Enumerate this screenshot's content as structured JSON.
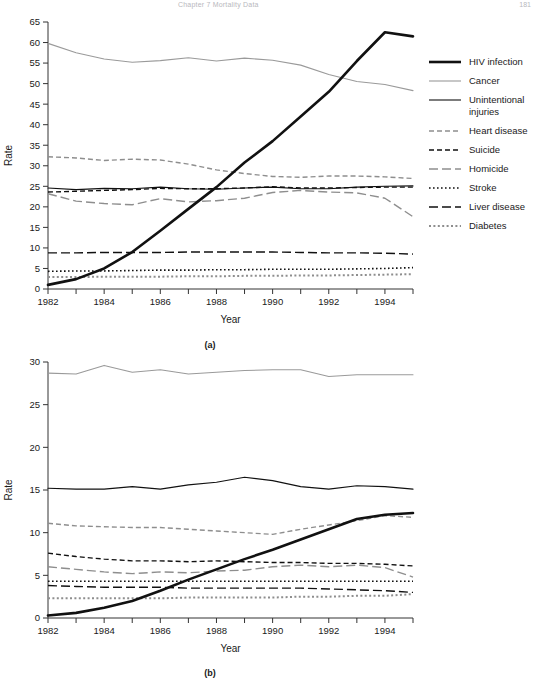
{
  "header": {
    "title": "Chapter 7   Mortality Data",
    "page": "181"
  },
  "figures": [
    {
      "id": "a",
      "caption": "(a)",
      "xlabel": "Year",
      "ylabel": "Rate"
    },
    {
      "id": "b",
      "caption": "(b)",
      "xlabel": "Year",
      "ylabel": "Rate"
    }
  ],
  "legend": {
    "items": [
      {
        "label": "HIV infection",
        "style": "solid-thick",
        "color": "#111111"
      },
      {
        "label": "Cancer",
        "style": "solid-light",
        "color": "#9a9a9a"
      },
      {
        "label": "Unintentional\ninjuries",
        "style": "solid-thin",
        "color": "#111111"
      },
      {
        "label": "Heart disease",
        "style": "dashed-gray",
        "color": "#8e8e8e"
      },
      {
        "label": "Suicide",
        "style": "dashed-dark",
        "color": "#111111"
      },
      {
        "label": "Homicide",
        "style": "longdash-gray",
        "color": "#8e8e8e"
      },
      {
        "label": "Stroke",
        "style": "dotted-dark",
        "color": "#111111"
      },
      {
        "label": "Liver disease",
        "style": "longdash-dark",
        "color": "#111111"
      },
      {
        "label": "Diabetes",
        "style": "dotted-gray",
        "color": "#8e8e8e"
      }
    ]
  },
  "chart_data": [
    {
      "id": "a",
      "type": "line",
      "title": "",
      "subtitle": "(a)",
      "xlabel": "Year",
      "ylabel": "Rate",
      "x": [
        1982,
        1983,
        1984,
        1985,
        1986,
        1987,
        1988,
        1989,
        1990,
        1991,
        1992,
        1993,
        1994,
        1995
      ],
      "xlim": [
        1982,
        1995
      ],
      "ylim": [
        0,
        65
      ],
      "yticks": [
        0,
        5,
        10,
        15,
        20,
        25,
        30,
        35,
        40,
        45,
        50,
        55,
        60,
        65
      ],
      "xticks": [
        1982,
        1984,
        1986,
        1988,
        1990,
        1992,
        1994
      ],
      "xminorticks": [
        1983,
        1985,
        1987,
        1989,
        1991,
        1993,
        1995
      ],
      "grid": false,
      "legend_position": "right",
      "series": [
        {
          "name": "HIV infection",
          "values": [
            1.0,
            2.4,
            5.0,
            9.0,
            14.2,
            19.5,
            24.8,
            30.8,
            36.0,
            42.0,
            48.0,
            55.5,
            62.5,
            61.5
          ]
        },
        {
          "name": "Cancer",
          "values": [
            59.8,
            57.5,
            56.0,
            55.2,
            55.6,
            56.3,
            55.5,
            56.2,
            55.7,
            54.5,
            52.2,
            50.5,
            49.8,
            48.3
          ]
        },
        {
          "name": "Unintentional injuries",
          "values": [
            24.6,
            24.2,
            24.5,
            24.4,
            24.8,
            24.4,
            24.3,
            24.6,
            24.8,
            24.4,
            24.4,
            24.8,
            25.0,
            25.1
          ]
        },
        {
          "name": "Heart disease",
          "values": [
            32.2,
            31.9,
            31.3,
            31.6,
            31.4,
            30.4,
            29.0,
            28.1,
            27.4,
            27.2,
            27.5,
            27.5,
            27.3,
            26.9
          ]
        },
        {
          "name": "Suicide",
          "values": [
            23.6,
            23.8,
            24.0,
            24.2,
            24.5,
            24.4,
            24.4,
            24.6,
            24.9,
            24.6,
            24.6,
            24.7,
            24.8,
            24.8
          ]
        },
        {
          "name": "Homicide",
          "values": [
            23.2,
            21.4,
            20.8,
            20.5,
            22.0,
            21.2,
            21.5,
            22.1,
            23.5,
            24.0,
            23.6,
            23.4,
            22.1,
            17.6
          ]
        },
        {
          "name": "Stroke",
          "values": [
            4.3,
            4.4,
            4.4,
            4.5,
            4.6,
            4.6,
            4.7,
            4.7,
            4.8,
            4.8,
            4.8,
            4.9,
            5.0,
            5.2
          ]
        },
        {
          "name": "Liver disease",
          "values": [
            8.8,
            8.8,
            8.9,
            8.9,
            8.9,
            9.0,
            9.0,
            9.0,
            9.0,
            8.9,
            8.8,
            8.8,
            8.7,
            8.5
          ]
        },
        {
          "name": "Diabetes",
          "values": [
            2.9,
            2.9,
            3.0,
            3.0,
            3.0,
            3.1,
            3.1,
            3.2,
            3.2,
            3.3,
            3.3,
            3.4,
            3.5,
            3.6
          ]
        }
      ]
    },
    {
      "id": "b",
      "type": "line",
      "title": "",
      "subtitle": "(b)",
      "xlabel": "Year",
      "ylabel": "Rate",
      "x": [
        1982,
        1983,
        1984,
        1985,
        1986,
        1987,
        1988,
        1989,
        1990,
        1991,
        1992,
        1993,
        1994,
        1995
      ],
      "xlim": [
        1982,
        1995
      ],
      "ylim": [
        0,
        30
      ],
      "yticks": [
        0,
        5,
        10,
        15,
        20,
        25,
        30
      ],
      "xticks": [
        1982,
        1984,
        1986,
        1988,
        1990,
        1992,
        1994
      ],
      "xminorticks": [
        1983,
        1985,
        1987,
        1989,
        1991,
        1993,
        1995
      ],
      "grid": false,
      "legend_position": "right",
      "series": [
        {
          "name": "HIV infection",
          "values": [
            0.3,
            0.6,
            1.2,
            2.0,
            3.2,
            4.5,
            5.7,
            6.9,
            8.0,
            9.2,
            10.4,
            11.6,
            12.1,
            12.3
          ]
        },
        {
          "name": "Cancer",
          "values": [
            28.7,
            28.6,
            29.6,
            28.8,
            29.1,
            28.6,
            28.8,
            29.0,
            29.1,
            29.1,
            28.3,
            28.5,
            28.5,
            28.5
          ]
        },
        {
          "name": "Unintentional injuries",
          "values": [
            15.2,
            15.1,
            15.1,
            15.4,
            15.1,
            15.6,
            15.9,
            16.5,
            16.1,
            15.4,
            15.1,
            15.5,
            15.4,
            15.1
          ]
        },
        {
          "name": "Heart disease",
          "values": [
            11.1,
            10.8,
            10.7,
            10.6,
            10.6,
            10.4,
            10.2,
            10.0,
            9.8,
            10.4,
            10.9,
            11.4,
            12.0,
            11.8
          ]
        },
        {
          "name": "Suicide",
          "values": [
            7.6,
            7.2,
            6.9,
            6.7,
            6.7,
            6.6,
            6.7,
            6.6,
            6.5,
            6.5,
            6.4,
            6.4,
            6.3,
            6.1
          ]
        },
        {
          "name": "Homicide",
          "values": [
            6.0,
            5.7,
            5.4,
            5.2,
            5.4,
            5.3,
            5.5,
            5.6,
            6.0,
            6.2,
            6.0,
            6.2,
            5.9,
            4.8
          ]
        },
        {
          "name": "Stroke",
          "values": [
            4.3,
            4.3,
            4.3,
            4.3,
            4.3,
            4.3,
            4.3,
            4.3,
            4.3,
            4.3,
            4.3,
            4.3,
            4.3,
            4.3
          ]
        },
        {
          "name": "Liver disease",
          "values": [
            3.8,
            3.7,
            3.6,
            3.6,
            3.6,
            3.5,
            3.5,
            3.5,
            3.5,
            3.5,
            3.4,
            3.3,
            3.2,
            3.0
          ]
        },
        {
          "name": "Diabetes",
          "values": [
            2.3,
            2.3,
            2.3,
            2.3,
            2.3,
            2.4,
            2.4,
            2.4,
            2.4,
            2.5,
            2.5,
            2.6,
            2.6,
            2.8
          ]
        }
      ]
    }
  ]
}
